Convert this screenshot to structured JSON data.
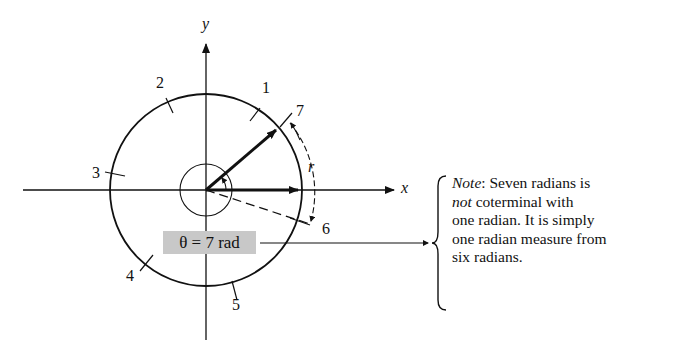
{
  "diagram": {
    "axes": {
      "x_label": "x",
      "y_label": "y"
    },
    "tick_labels": [
      "1",
      "2",
      "3",
      "4",
      "5",
      "6",
      "7"
    ],
    "arc_label": "r",
    "angle_label": "θ = 7 rad",
    "note": {
      "prefix_italic": "Note",
      "line1_rest": ":   Seven radians is",
      "line2_italic": "not",
      "line2_rest": " coterminal with",
      "line3": "one radian. It is simply",
      "line4": "one radian measure from",
      "line5": "six radians."
    }
  }
}
